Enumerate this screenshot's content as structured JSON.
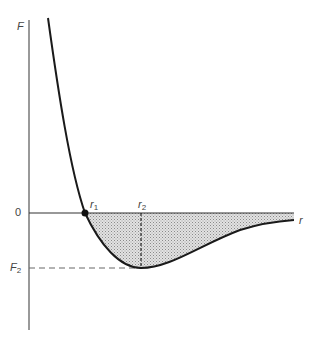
{
  "diagram": {
    "type": "potential-curve",
    "axis_labels": {
      "y": "F",
      "x": "r"
    },
    "zero_label": "0",
    "min_label": {
      "base": "F",
      "sub": "2"
    },
    "points": [
      {
        "name": "r1",
        "base": "r",
        "sub": "1",
        "desc": "curve crosses zero"
      },
      {
        "name": "r2",
        "base": "r",
        "sub": "2",
        "desc": "curve minimum at F2"
      }
    ],
    "colors": {
      "curve": "#1a1a1a",
      "axis": "#555555",
      "shade": "#c8c8c8"
    }
  }
}
